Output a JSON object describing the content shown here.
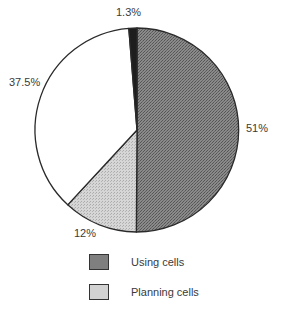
{
  "chart_data": {
    "type": "pie",
    "title": "",
    "start_angle_deg": 0,
    "direction": "clockwise",
    "slices": [
      {
        "label": "Using cells",
        "value": 51,
        "display": "51%",
        "color": "#7a7a7a",
        "pattern": "dark-stipple"
      },
      {
        "label": "Planning cells",
        "value": 12,
        "display": "12%",
        "color": "#cfcfcf",
        "pattern": "light-stipple"
      },
      {
        "label": "",
        "value": 37.5,
        "display": "37.5%",
        "color": "#ffffff",
        "pattern": "none"
      },
      {
        "label": "",
        "value": 1.3,
        "display": "1.3%",
        "color": "#1e1e1e",
        "pattern": "solid"
      }
    ],
    "legend": [
      {
        "label": "Using cells",
        "color": "#7a7a7a"
      },
      {
        "label": "Planning cells",
        "color": "#cfcfcf"
      }
    ],
    "legend_position": "bottom"
  },
  "labels": {
    "using": "51%",
    "planning": "12%",
    "white": "37.5%",
    "dark": "1.3%"
  },
  "legend": {
    "using": "Using cells",
    "planning": "Planning cells"
  }
}
